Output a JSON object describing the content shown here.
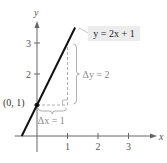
{
  "chart_data": {
    "type": "line",
    "title": "",
    "xlabel": "x",
    "ylabel": "y",
    "xlim": [
      -0.8,
      3.6
    ],
    "ylim": [
      -0.1,
      3.6
    ],
    "xticks": [
      1,
      2,
      3
    ],
    "yticks": [
      1,
      2,
      3
    ],
    "xtick_labels": [
      "1",
      "2",
      "3"
    ],
    "ytick_labels": [
      "1",
      "2",
      "3"
    ],
    "grid": false,
    "series": [
      {
        "name": "y = 2x + 1",
        "slope": 2,
        "intercept": 1,
        "x": [
          -0.5,
          1.25
        ],
        "y": [
          0,
          3.5
        ]
      }
    ],
    "point": {
      "x": 0,
      "y": 1,
      "label": "(0, 1)"
    },
    "equation_label": "y = 2x + 1",
    "annotations": {
      "delta_x": {
        "label": "Δx = 1",
        "from": [
          0,
          1
        ],
        "to": [
          1,
          1
        ]
      },
      "delta_y": {
        "label": "Δy = 2",
        "from": [
          1,
          1
        ],
        "to": [
          1,
          3
        ]
      }
    },
    "colors": {
      "line": "#111111",
      "axis": "#666666",
      "guide": "#999999",
      "label_box": "#ececec"
    }
  }
}
